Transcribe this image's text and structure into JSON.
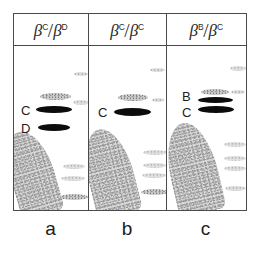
{
  "figure": {
    "kind": "electrophoresis-gel-figure",
    "panel_count": 3
  },
  "header": {
    "cells": [
      {
        "numerator_base": "β",
        "numerator_sup": "C",
        "slash": "/",
        "denominator_base": "β",
        "denominator_sup": "D"
      },
      {
        "numerator_base": "β",
        "numerator_sup": "C",
        "slash": "/",
        "denominator_base": "β",
        "denominator_sup": "C"
      },
      {
        "numerator_base": "β",
        "numerator_sup": "B",
        "slash": "/",
        "denominator_base": "β",
        "denominator_sup": "C"
      }
    ]
  },
  "panels": [
    {
      "id": "a",
      "caption": "a",
      "genotype": "βC/βD",
      "band_labels": [
        {
          "text": "C",
          "x": 7,
          "y": 58
        },
        {
          "text": "D",
          "x": 7,
          "y": 76
        }
      ],
      "dark_bands": [
        {
          "x": 22,
          "y": 60,
          "w": 36,
          "h": 7
        },
        {
          "x": 24,
          "y": 78,
          "w": 32,
          "h": 7
        }
      ],
      "faint_bands": [
        {
          "x": 26,
          "y": 47,
          "w": 31,
          "h": 7,
          "class": "band-faint"
        },
        {
          "x": 60,
          "y": 26,
          "w": 14,
          "h": 4,
          "class": "band-vfaint"
        },
        {
          "x": 59,
          "y": 54,
          "w": 16,
          "h": 5,
          "class": "band-vfaint"
        },
        {
          "x": 49,
          "y": 118,
          "w": 22,
          "h": 5,
          "class": "band-vfaint"
        },
        {
          "x": 47,
          "y": 130,
          "w": 24,
          "h": 5,
          "class": "band-vfaint"
        },
        {
          "x": 46,
          "y": 148,
          "w": 28,
          "h": 6,
          "class": "band-faint"
        }
      ],
      "blob": {
        "x": -4,
        "y": 84,
        "w": 44,
        "h": 86,
        "radius": "45% 55% 14% 10% / 62% 58% 10% 8%",
        "rotate": -16
      }
    },
    {
      "id": "b",
      "caption": "b",
      "genotype": "βC/βC",
      "band_labels": [
        {
          "text": "C",
          "x": 9,
          "y": 60
        }
      ],
      "dark_bands": [
        {
          "x": 25,
          "y": 62,
          "w": 37,
          "h": 8
        }
      ],
      "faint_bands": [
        {
          "x": 29,
          "y": 48,
          "w": 30,
          "h": 7,
          "class": "band-faint"
        },
        {
          "x": 61,
          "y": 22,
          "w": 15,
          "h": 4,
          "class": "band-vfaint"
        },
        {
          "x": 63,
          "y": 52,
          "w": 12,
          "h": 4,
          "class": "band-vfaint"
        },
        {
          "x": 54,
          "y": 104,
          "w": 24,
          "h": 5,
          "class": "band-vfaint"
        },
        {
          "x": 54,
          "y": 117,
          "w": 23,
          "h": 5,
          "class": "band-vfaint"
        },
        {
          "x": 53,
          "y": 127,
          "w": 24,
          "h": 5,
          "class": "band-vfaint"
        },
        {
          "x": 52,
          "y": 143,
          "w": 27,
          "h": 6,
          "class": "band-faint"
        }
      ],
      "blob": {
        "x": -2,
        "y": 82,
        "w": 46,
        "h": 88,
        "radius": "48% 52% 14% 10% / 60% 60% 10% 8%",
        "rotate": -14
      }
    },
    {
      "id": "c",
      "caption": "c",
      "genotype": "βB/βC",
      "band_labels": [
        {
          "text": "B",
          "x": 15,
          "y": 44
        },
        {
          "text": "C",
          "x": 15,
          "y": 60
        }
      ],
      "dark_bands": [
        {
          "x": 31,
          "y": 51,
          "w": 35,
          "h": 6
        },
        {
          "x": 31,
          "y": 60,
          "w": 36,
          "h": 7
        }
      ],
      "faint_bands": [
        {
          "x": 34,
          "y": 43,
          "w": 28,
          "h": 6,
          "class": "band-faint"
        },
        {
          "x": 63,
          "y": 20,
          "w": 16,
          "h": 5,
          "class": "band-vfaint"
        },
        {
          "x": 64,
          "y": 44,
          "w": 14,
          "h": 4,
          "class": "band-vfaint"
        },
        {
          "x": 57,
          "y": 96,
          "w": 22,
          "h": 5,
          "class": "band-vfaint"
        },
        {
          "x": 57,
          "y": 110,
          "w": 22,
          "h": 5,
          "class": "band-vfaint"
        },
        {
          "x": 57,
          "y": 120,
          "w": 22,
          "h": 5,
          "class": "band-vfaint"
        },
        {
          "x": 58,
          "y": 140,
          "w": 21,
          "h": 5,
          "class": "band-vfaint"
        }
      ],
      "blob": {
        "x": 2,
        "y": 76,
        "w": 48,
        "h": 92,
        "radius": "50% 50% 14% 10% / 58% 62% 10% 8%",
        "rotate": -13
      }
    }
  ],
  "colors": {
    "frame": "#4a4a4a",
    "band_dark": "#0c0c0c",
    "band_faint": "#c9c9c9",
    "blob": "#d9d9d9",
    "text": "#1c1c1c",
    "background": "#ffffff"
  }
}
